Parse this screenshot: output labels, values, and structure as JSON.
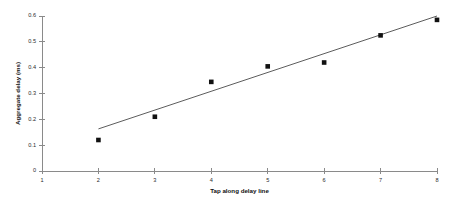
{
  "chart_data": {
    "type": "scatter",
    "title": "",
    "xlabel": "Tap along delay line",
    "ylabel": "Aggregate delay (ms)",
    "xlim": [
      1,
      8
    ],
    "ylim": [
      0,
      0.6
    ],
    "grid": false,
    "legend": null,
    "x": [
      2,
      3,
      4,
      5,
      6,
      7,
      8
    ],
    "values": [
      0.12,
      0.21,
      0.345,
      0.405,
      0.42,
      0.525,
      0.585
    ],
    "series": [
      {
        "name": "Aggregate delay",
        "marker": "square",
        "x": [
          2,
          3,
          4,
          5,
          6,
          7,
          8
        ],
        "values": [
          0.12,
          0.21,
          0.345,
          0.405,
          0.42,
          0.525,
          0.585
        ]
      }
    ],
    "trend_line": {
      "name": "linear fit",
      "x": [
        2,
        8
      ],
      "values": [
        0.163,
        0.6
      ]
    },
    "xticks": [
      1,
      2,
      3,
      4,
      5,
      6,
      7,
      8
    ],
    "xtick_labels": [
      "1",
      "2",
      "3",
      "4",
      "5",
      "6",
      "7",
      "8"
    ],
    "yticks": [
      0,
      0.1,
      0.2,
      0.3,
      0.4,
      0.5,
      0.6
    ],
    "ytick_labels": [
      "0",
      "0.1",
      "0.2",
      "0.3",
      "0.4",
      "0.5",
      "0.6"
    ],
    "colors": {
      "marker": "#111111",
      "trend": "#4a4a4a",
      "axis": "#8a8a8a",
      "background": "#ffffff"
    }
  }
}
